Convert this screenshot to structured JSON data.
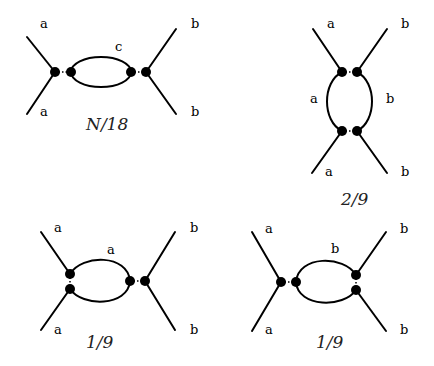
{
  "diagrams": [
    {
      "id": "d1",
      "external_labels": {
        "top_left": "a",
        "bottom_left": "a",
        "top_right": "b",
        "bottom_right": "b"
      },
      "loop_labels": [
        "c"
      ],
      "weight": "N/18"
    },
    {
      "id": "d2",
      "external_labels": {
        "top_left": "a",
        "bottom_left": "a",
        "top_right": "b",
        "bottom_right": "b"
      },
      "loop_labels": [
        "a",
        "b"
      ],
      "weight": "2/9"
    },
    {
      "id": "d3",
      "external_labels": {
        "top_left": "a",
        "bottom_left": "a",
        "top_right": "b",
        "bottom_right": "b"
      },
      "loop_labels": [
        "a"
      ],
      "weight": "1/9"
    },
    {
      "id": "d4",
      "external_labels": {
        "top_left": "a",
        "bottom_left": "a",
        "top_right": "b",
        "bottom_right": "b"
      },
      "loop_labels": [
        "b"
      ],
      "weight": "1/9"
    }
  ]
}
